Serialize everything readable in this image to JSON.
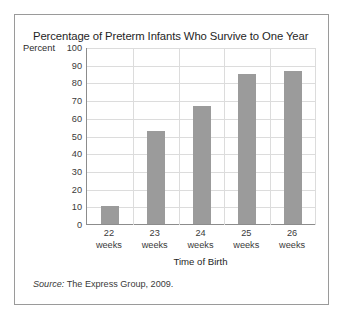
{
  "figure": {
    "title": "Percentage of Preterm Infants Who Survive to One Year",
    "source_prefix": "Source:",
    "source_text": " The Express Group, 2009.",
    "border_color": "#9a9a9a"
  },
  "chart_data": {
    "type": "bar",
    "title": "Percentage of Preterm Infants Who Survive to One Year",
    "xlabel": "Time of Birth",
    "ylabel": "Percent",
    "categories": [
      "22 weeks",
      "23 weeks",
      "24 weeks",
      "25 weeks",
      "26 weeks"
    ],
    "category_lines": [
      {
        "num": "22",
        "word": "weeks"
      },
      {
        "num": "23",
        "word": "weeks"
      },
      {
        "num": "24",
        "word": "weeks"
      },
      {
        "num": "25",
        "word": "weeks"
      },
      {
        "num": "26",
        "word": "weeks"
      }
    ],
    "values": [
      10,
      53,
      67,
      85,
      87
    ],
    "ylim": [
      0,
      100
    ],
    "ytick_values": [
      100,
      90,
      80,
      70,
      60,
      50,
      40,
      30,
      20,
      10,
      0
    ],
    "ytick_labels": [
      "100",
      "90",
      "80",
      "70",
      "60",
      "50",
      "40",
      "30",
      "20",
      "10",
      "0"
    ],
    "grid": true,
    "legend": false,
    "bar_color": "#9b9b9b",
    "grid_color": "#dcdcdc",
    "axis_color": "#8c8c8c"
  }
}
